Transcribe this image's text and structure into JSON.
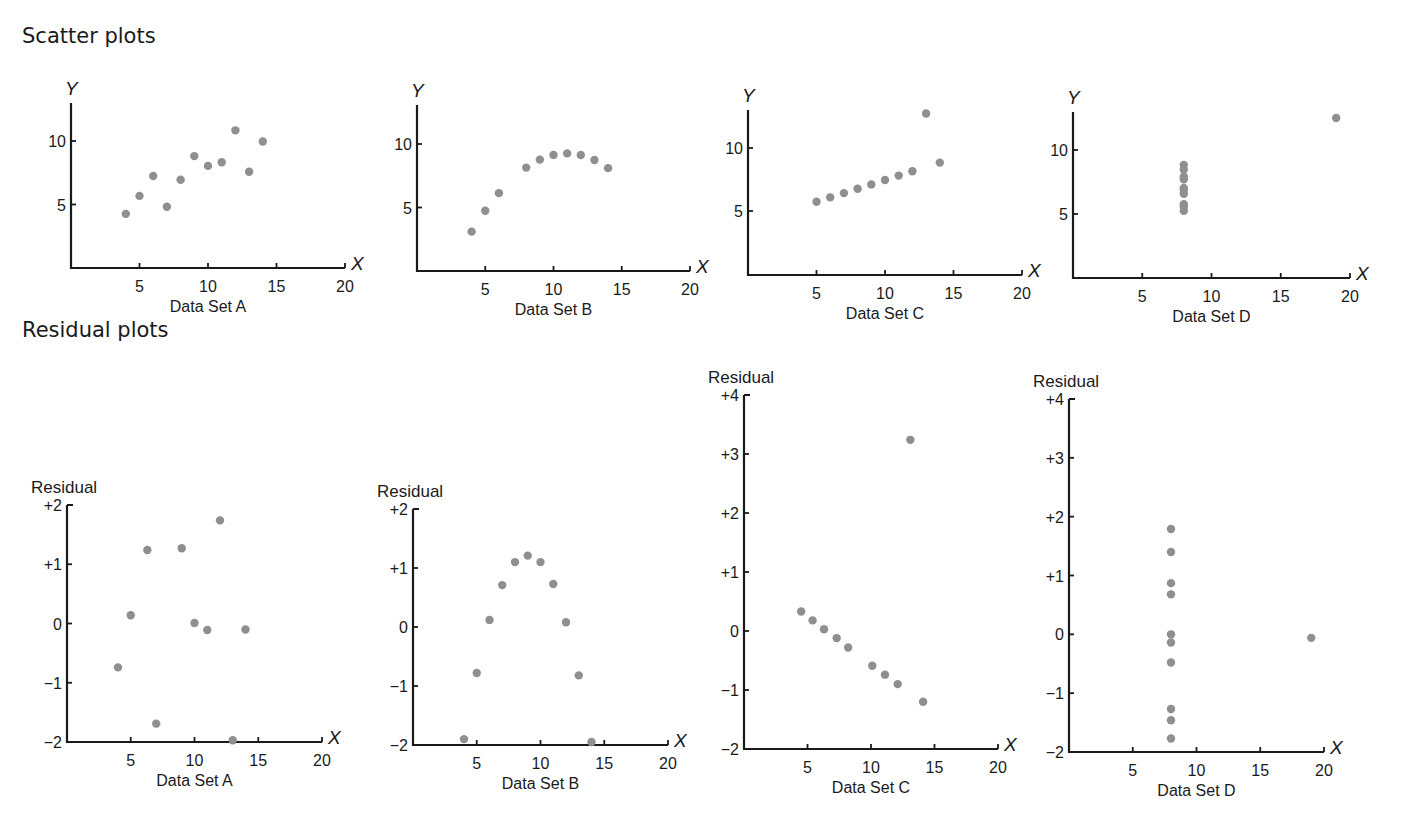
{
  "sections": {
    "scatter_title": "Scatter plots",
    "residual_title": "Residual plots"
  },
  "colors": {
    "point": "#8f8f8f",
    "axis": "#1a1a1a"
  },
  "chart_data": [
    {
      "id": "scatter-a",
      "type": "scatter",
      "group": "Scatter plots",
      "title": "Data Set A",
      "xlabel": "X",
      "ylabel": "Y",
      "xlim": [
        0,
        20
      ],
      "ylim": [
        0,
        13
      ],
      "xticks": [
        5,
        10,
        15,
        20
      ],
      "yticks": [
        5,
        10
      ],
      "grid": false,
      "x": [
        4,
        5,
        6,
        7,
        8,
        9,
        10,
        11,
        12,
        13,
        14
      ],
      "y": [
        4.26,
        5.68,
        7.24,
        4.82,
        6.95,
        8.81,
        8.04,
        8.33,
        10.84,
        7.58,
        9.96
      ]
    },
    {
      "id": "scatter-b",
      "type": "scatter",
      "group": "Scatter plots",
      "title": "Data Set B",
      "xlabel": "X",
      "ylabel": "Y",
      "xlim": [
        0,
        20
      ],
      "ylim": [
        0,
        13
      ],
      "xticks": [
        5,
        10,
        15,
        20
      ],
      "yticks": [
        5,
        10
      ],
      "grid": false,
      "x": [
        4,
        5,
        6,
        8,
        9,
        10,
        11,
        12,
        13,
        14
      ],
      "y": [
        3.1,
        4.74,
        6.13,
        8.14,
        8.77,
        9.14,
        9.26,
        9.13,
        8.74,
        8.1
      ]
    },
    {
      "id": "scatter-c",
      "type": "scatter",
      "group": "Scatter plots",
      "title": "Data Set C",
      "xlabel": "X",
      "ylabel": "Y",
      "xlim": [
        0,
        20
      ],
      "ylim": [
        0,
        13
      ],
      "xticks": [
        5,
        10,
        15,
        20
      ],
      "yticks": [
        5,
        10
      ],
      "grid": false,
      "x": [
        5,
        6,
        7,
        8,
        9,
        10,
        11,
        12,
        13,
        14
      ],
      "y": [
        5.73,
        6.08,
        6.42,
        6.77,
        7.11,
        7.46,
        7.81,
        8.15,
        12.74,
        8.84
      ]
    },
    {
      "id": "scatter-d",
      "type": "scatter",
      "group": "Scatter plots",
      "title": "Data Set D",
      "xlabel": "X",
      "ylabel": "Y",
      "xlim": [
        0,
        20
      ],
      "ylim": [
        0,
        13
      ],
      "xticks": [
        5,
        10,
        15,
        20
      ],
      "yticks": [
        5,
        10
      ],
      "grid": false,
      "x": [
        8,
        8,
        8,
        8,
        8,
        8,
        8,
        8,
        8,
        8,
        19
      ],
      "y": [
        5.25,
        5.56,
        5.76,
        6.58,
        6.89,
        7.04,
        7.71,
        7.91,
        8.47,
        8.84,
        12.5
      ]
    },
    {
      "id": "residual-a",
      "type": "scatter",
      "group": "Residual plots",
      "title": "Data Set A",
      "xlabel": "X",
      "ylabel": "Residual",
      "xlim": [
        0,
        20
      ],
      "ylim": [
        -2,
        2
      ],
      "xticks": [
        5,
        10,
        15,
        20
      ],
      "yticks": [
        -2,
        -1,
        0,
        1,
        2
      ],
      "ytick_labels": [
        "−2",
        "−1",
        "0",
        "+1",
        "+2"
      ],
      "grid": false,
      "x": [
        4,
        5,
        6.3,
        7,
        9,
        10,
        11,
        12,
        13,
        14
      ],
      "y": [
        -0.74,
        0.14,
        1.24,
        -1.69,
        1.27,
        0.01,
        -0.11,
        1.74,
        -1.97,
        -0.1
      ]
    },
    {
      "id": "residual-b",
      "type": "scatter",
      "group": "Residual plots",
      "title": "Data Set B",
      "xlabel": "X",
      "ylabel": "Residual",
      "xlim": [
        0,
        20
      ],
      "ylim": [
        -2,
        2
      ],
      "xticks": [
        5,
        10,
        15,
        20
      ],
      "yticks": [
        -2,
        -1,
        0,
        1,
        2
      ],
      "ytick_labels": [
        "−2",
        "−1",
        "0",
        "+1",
        "+2"
      ],
      "grid": false,
      "x": [
        4,
        5,
        6,
        7,
        8,
        9,
        10,
        11,
        12,
        13,
        14
      ],
      "y": [
        -1.9,
        -0.78,
        0.12,
        0.71,
        1.1,
        1.21,
        1.1,
        0.73,
        0.08,
        -0.82,
        -1.95
      ]
    },
    {
      "id": "residual-c",
      "type": "scatter",
      "group": "Residual plots",
      "title": "Data Set C",
      "xlabel": "X",
      "ylabel": "Residual",
      "xlim": [
        0,
        20
      ],
      "ylim": [
        -2,
        4
      ],
      "xticks": [
        5,
        10,
        15,
        20
      ],
      "yticks": [
        -2,
        -1,
        0,
        1,
        2,
        3,
        4
      ],
      "ytick_labels": [
        "−2",
        "−1",
        "0",
        "+1",
        "+2",
        "+3",
        "+4"
      ],
      "grid": false,
      "x": [
        4.5,
        5.4,
        6.3,
        7.3,
        8.2,
        10.1,
        11.1,
        12.1,
        13.1,
        14.1
      ],
      "y": [
        0.33,
        0.18,
        0.03,
        -0.12,
        -0.28,
        -0.59,
        -0.74,
        -0.9,
        3.24,
        -1.2
      ]
    },
    {
      "id": "residual-d",
      "type": "scatter",
      "group": "Residual plots",
      "title": "Data Set D",
      "xlabel": "X",
      "ylabel": "Residual",
      "xlim": [
        0,
        20
      ],
      "ylim": [
        -2,
        4
      ],
      "xticks": [
        5,
        10,
        15,
        20
      ],
      "yticks": [
        -2,
        -1,
        0,
        1,
        2,
        3,
        4
      ],
      "ytick_labels": [
        "−2",
        "−1",
        "0",
        "+1",
        "+2",
        "+3",
        "+4"
      ],
      "grid": false,
      "x": [
        8,
        8,
        8,
        8,
        8,
        8,
        8,
        8,
        8,
        8,
        19
      ],
      "y": [
        1.79,
        1.4,
        0.87,
        0.68,
        0.0,
        -0.14,
        -0.48,
        -1.27,
        -1.46,
        -1.77,
        -0.06
      ]
    }
  ]
}
